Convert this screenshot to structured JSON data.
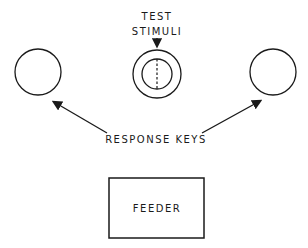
{
  "labels": {
    "test_line1": "TEST",
    "test_line2": "STIMULI",
    "response_keys": "RESPONSE KEYS",
    "feeder": "FEEDER"
  },
  "colors": {
    "stroke": "#1a1a1a",
    "background": "#ffffff"
  }
}
